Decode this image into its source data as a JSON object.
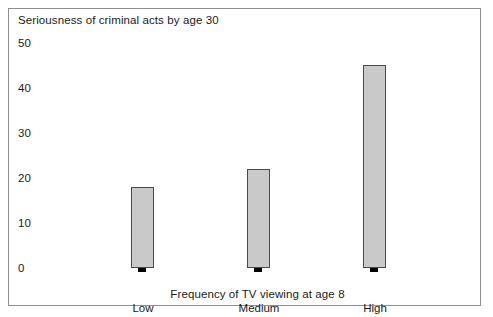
{
  "chart_data": {
    "type": "bar",
    "title": "Seriousness of criminal acts by age 30",
    "xlabel": "Frequency of TV viewing at age 8",
    "ylabel": "",
    "categories": [
      "Low",
      "Medium",
      "High"
    ],
    "values": [
      18,
      22,
      45
    ],
    "yticks": [
      0,
      10,
      20,
      30,
      40,
      50
    ],
    "ytick_labels": [
      "0",
      "10",
      "20",
      "30",
      "40",
      "50"
    ],
    "ylim": [
      0,
      50
    ],
    "grid": false,
    "legend": "none",
    "bar_style": {
      "face_color": "#c9c9c9",
      "edge_color": "#4a4a4a",
      "shadow_color": "#000000"
    }
  },
  "figure": {
    "border_color": "#8f8f8f",
    "background": "#ffffff"
  }
}
